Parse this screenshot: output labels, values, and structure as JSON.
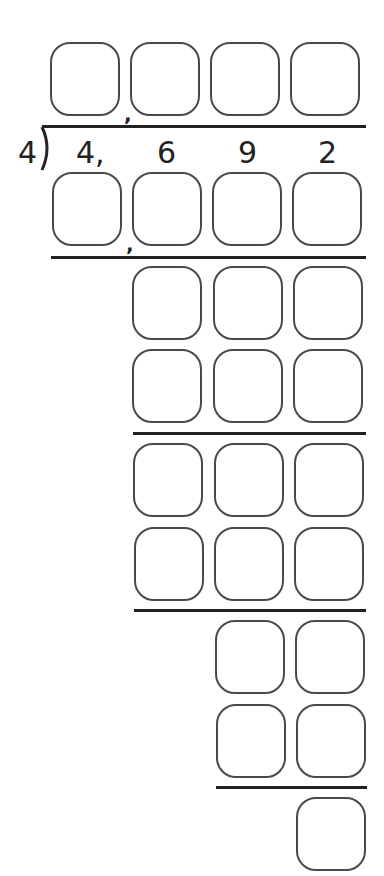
{
  "problem": {
    "divisor": "4",
    "dividend_digits": [
      "4,",
      "6",
      "9",
      "2"
    ],
    "separator": ","
  },
  "worksheet": {
    "quotient_boxes": 4,
    "rows": [
      {
        "name": "step1-product",
        "boxes": 4
      },
      {
        "name": "step2-remainder",
        "boxes": 3
      },
      {
        "name": "step2-product",
        "boxes": 3
      },
      {
        "name": "step3-remainder",
        "boxes": 3
      },
      {
        "name": "step3-product",
        "boxes": 3
      },
      {
        "name": "step4-remainder",
        "boxes": 2
      },
      {
        "name": "step4-product",
        "boxes": 2
      },
      {
        "name": "final-remainder",
        "boxes": 1
      }
    ]
  }
}
